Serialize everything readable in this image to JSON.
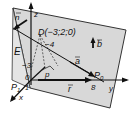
{
  "diagram": {
    "plane_label": "E",
    "axes": {
      "x": "x",
      "y": "y",
      "z": "z"
    },
    "origin_label": "0",
    "point_D": "D(−3;2;0)",
    "tick_neg3": "−3",
    "tick_neg4": "−4",
    "tick_8": "8",
    "tick_1": "1",
    "point_P0": "P",
    "point_P0_sub": "0",
    "point_P": "P",
    "point_P1": "P",
    "point_P1_sub": "1",
    "vector_n": "n",
    "vector_a": "a",
    "vector_b": "b",
    "vector_r": "r",
    "vector_p": "p",
    "colors": {
      "plane": "#d9d9d9",
      "line": "#111111",
      "background": "#ffffff"
    }
  }
}
